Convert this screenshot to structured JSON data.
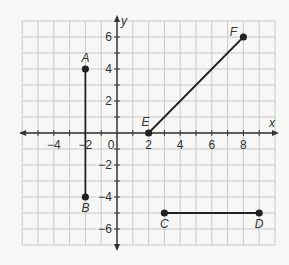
{
  "diagram": {
    "type": "coordinate-plane",
    "x_axis_label": "x",
    "y_axis_label": "y",
    "x_range": [
      -6,
      10
    ],
    "y_range": [
      -7,
      7
    ],
    "x_tick_labels": [
      "-4",
      "-2",
      "0",
      "2",
      "4",
      "6",
      "8"
    ],
    "y_tick_labels": [
      "6",
      "4",
      "2",
      "-2",
      "-4",
      "-6"
    ],
    "colors": {
      "grid": "#c9c9c9",
      "axis": "#333333",
      "segment": "#222222",
      "background": "#f7f7f5"
    },
    "points": [
      {
        "label": "A",
        "x": -2,
        "y": 4
      },
      {
        "label": "B",
        "x": -2,
        "y": -4
      },
      {
        "label": "C",
        "x": 3,
        "y": -5
      },
      {
        "label": "D",
        "x": 9,
        "y": -5
      },
      {
        "label": "E",
        "x": 2,
        "y": 0
      },
      {
        "label": "F",
        "x": 8,
        "y": 6
      }
    ],
    "segments": [
      {
        "name": "AB",
        "from": "A",
        "to": "B"
      },
      {
        "name": "CD",
        "from": "C",
        "to": "D"
      },
      {
        "name": "EF",
        "from": "E",
        "to": "F"
      }
    ]
  }
}
